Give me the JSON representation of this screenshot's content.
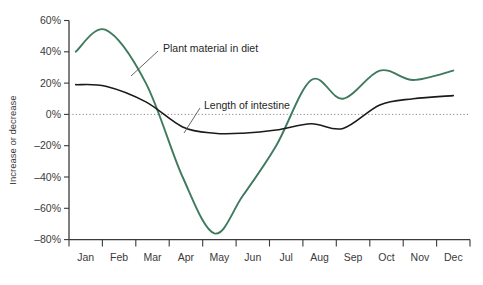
{
  "chart_data": {
    "type": "line",
    "title": "",
    "subtitle": "",
    "xlabel": "",
    "ylabel": "Increase or decrease",
    "categories": [
      "Jan",
      "Feb",
      "Mar",
      "Apr",
      "May",
      "Jun",
      "Jul",
      "Aug",
      "Sep",
      "Oct",
      "Nov",
      "Dec"
    ],
    "xlim": [
      0,
      12
    ],
    "ylim": [
      -80,
      60
    ],
    "yticks": [
      60,
      40,
      20,
      0,
      -20,
      -40,
      -60,
      -80
    ],
    "ytick_labels": [
      "60%",
      "40%",
      "20%",
      "0%",
      "–20%",
      "–40%",
      "–60%",
      "–80%"
    ],
    "grid": false,
    "zero_line": true,
    "zero_line_style": "dotted",
    "legend_position": "inline-annotations",
    "series": [
      {
        "name": "Plant material in diet",
        "color": "#3f7a5e",
        "values": [
          40,
          54,
          20,
          -40,
          -76,
          -52,
          -20,
          22,
          10,
          28,
          22,
          28
        ],
        "x": [
          0.2,
          1.1,
          2.3,
          3.4,
          4.35,
          5.2,
          6.2,
          7.25,
          8.2,
          9.3,
          10.3,
          11.5
        ]
      },
      {
        "name": "Length of intestine",
        "color": "#1a1a1a",
        "values": [
          19,
          18,
          8,
          -8,
          -12,
          -12,
          -10,
          -6,
          -9,
          6,
          10,
          12
        ],
        "x": [
          0.2,
          1.1,
          2.3,
          3.4,
          4.35,
          5.2,
          6.2,
          7.25,
          8.2,
          9.3,
          10.3,
          11.5
        ]
      }
    ],
    "annotations": [
      {
        "label": "Plant material in diet",
        "text_x": 163,
        "text_y": 48,
        "leader_from_x": 158,
        "leader_from_y": 51,
        "leader_to_x": 131,
        "leader_to_y": 76
      },
      {
        "label": "Length of intestine",
        "label_id": "length-of-intestine",
        "text_x": 204,
        "text_y": 105,
        "leader_from_x": 200,
        "leader_from_y": 108,
        "leader_to_x": 184,
        "leader_to_y": 133
      }
    ]
  },
  "axis": {
    "y_title": "Increase or decrease",
    "y_tick_0": "60%",
    "y_tick_1": "40%",
    "y_tick_2": "20%",
    "y_tick_3": "0%",
    "y_tick_4": "–20%",
    "y_tick_5": "–40%",
    "y_tick_6": "–60%",
    "y_tick_7": "–80%",
    "x_tick_0": "Jan",
    "x_tick_1": "Feb",
    "x_tick_2": "Mar",
    "x_tick_3": "Apr",
    "x_tick_4": "May",
    "x_tick_5": "Jun",
    "x_tick_6": "Jul",
    "x_tick_7": "Aug",
    "x_tick_8": "Sep",
    "x_tick_9": "Oct",
    "x_tick_10": "Nov",
    "x_tick_11": "Dec"
  },
  "annotation_labels": {
    "plant_material": "Plant material in diet",
    "length_intestine": "Length of intestine"
  },
  "colors": {
    "series_plant": "#3f7a5e",
    "series_intestine": "#1a1a1a",
    "axis": "#3a3a3a",
    "zero_line": "#8a8a8a",
    "background": "#ffffff"
  }
}
